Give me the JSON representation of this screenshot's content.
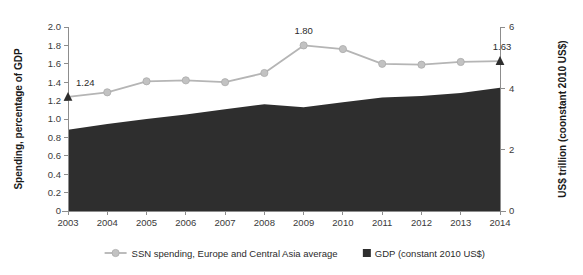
{
  "chart_data": {
    "type": "area",
    "title": "",
    "categories": [
      "2003",
      "2004",
      "2005",
      "2006",
      "2007",
      "2008",
      "2009",
      "2010",
      "2011",
      "2012",
      "2013",
      "2014"
    ],
    "series": [
      {
        "name": "SSN spending, Europe and Central Asia average",
        "type": "line",
        "axis": "left",
        "color": "#b5b5b5",
        "marker": "circle",
        "values": [
          1.24,
          1.29,
          1.41,
          1.42,
          1.4,
          1.5,
          1.8,
          1.76,
          1.6,
          1.59,
          1.62,
          1.63
        ]
      },
      {
        "name": "GDP (constant 2010 US$)",
        "type": "area",
        "axis": "right",
        "color": "#2e2e2e",
        "values": [
          2.65,
          2.84,
          3.0,
          3.15,
          3.32,
          3.48,
          3.38,
          3.55,
          3.7,
          3.75,
          3.85,
          4.02
        ]
      }
    ],
    "annotations": [
      {
        "name": "first-point-label",
        "text": "1.24",
        "category": "2003",
        "value": 1.24
      },
      {
        "name": "peak-point-label",
        "text": "1.80",
        "category": "2009",
        "value": 1.8
      },
      {
        "name": "last-point-label",
        "text": "1.63",
        "category": "2014",
        "value": 1.63
      }
    ],
    "endpoint_markers": [
      {
        "name": "start-triangle-marker",
        "category": "2003",
        "value": 1.24,
        "shape": "triangle",
        "color": "#2e2e2e"
      },
      {
        "name": "end-triangle-marker",
        "category": "2014",
        "value": 1.63,
        "shape": "triangle",
        "color": "#2e2e2e"
      }
    ],
    "left_axis": {
      "label": "Spending, percentage of GDP",
      "ticks": [
        "0",
        "0.2",
        "0.4",
        "0.6",
        "0.8",
        "1.0",
        "1.2",
        "1.4",
        "1.6",
        "1.8",
        "2.0"
      ],
      "tick_values": [
        0,
        0.2,
        0.4,
        0.6,
        0.8,
        1.0,
        1.2,
        1.4,
        1.6,
        1.8,
        2.0
      ],
      "min": 0,
      "max": 2.0
    },
    "right_axis": {
      "label": "US$ trillion (coonstant 2010 US$)",
      "ticks": [
        "0",
        "2",
        "4",
        "6"
      ],
      "tick_values": [
        0,
        2,
        4,
        6
      ],
      "min": 0,
      "max": 6
    },
    "x_axis": {
      "label": "",
      "ticks": [
        "2003",
        "2004",
        "2005",
        "2006",
        "2007",
        "2008",
        "2009",
        "2010",
        "2011",
        "2012",
        "2013",
        "2014"
      ]
    },
    "grid": false,
    "legend_position": "bottom",
    "legend": [
      {
        "name": "legend-ssn-spending",
        "label": "SSN spending, Europe and Central Asia average",
        "marker": "line-circle",
        "color": "#b5b5b5"
      },
      {
        "name": "legend-gdp",
        "label": "GDP (constant 2010 US$)",
        "marker": "square",
        "color": "#2e2e2e"
      }
    ]
  }
}
